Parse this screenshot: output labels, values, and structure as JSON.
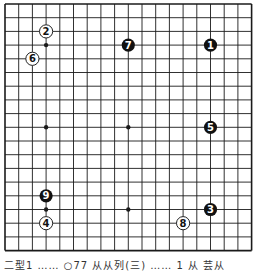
{
  "diagram": {
    "type": "go-board",
    "size": 19,
    "grid": {
      "origin_x": 5,
      "origin_y": 4,
      "pitch": 13.7
    },
    "colors": {
      "line": "#1a1a1a",
      "black_stone": "#111111",
      "white_stone": "#ffffff",
      "white_text": "#ffffff",
      "black_text": "#111111"
    },
    "star_points": [
      [
        3,
        3
      ],
      [
        9,
        3
      ],
      [
        15,
        3
      ],
      [
        3,
        9
      ],
      [
        9,
        9
      ],
      [
        15,
        9
      ],
      [
        3,
        15
      ],
      [
        9,
        15
      ],
      [
        15,
        15
      ]
    ],
    "stones": [
      {
        "move": "1",
        "color": "black",
        "col": 15,
        "row": 3
      },
      {
        "move": "2",
        "color": "white",
        "col": 3,
        "row": 2
      },
      {
        "move": "3",
        "color": "black",
        "col": 15,
        "row": 15
      },
      {
        "move": "4",
        "color": "white",
        "col": 3,
        "row": 16
      },
      {
        "move": "5",
        "color": "black",
        "col": 15,
        "row": 9
      },
      {
        "move": "6",
        "color": "white",
        "col": 2,
        "row": 4
      },
      {
        "move": "7",
        "color": "black",
        "col": 9,
        "row": 3
      },
      {
        "move": "8",
        "color": "white",
        "col": 13,
        "row": 16
      },
      {
        "move": "9",
        "color": "black",
        "col": 3,
        "row": 14
      }
    ]
  },
  "caption": {
    "text": "二型1 ……  ○77 从从列(三) …… 1 从 芸从"
  }
}
